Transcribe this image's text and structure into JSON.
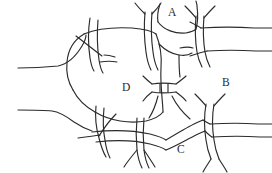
{
  "figure": {
    "background_color": "#ffffff",
    "stroke_color": "#2b2b2b",
    "label_color": "#2b2b2b",
    "width": 272,
    "height": 173,
    "labels": [
      {
        "id": "A",
        "text": "A",
        "x": 168,
        "y": 7
      },
      {
        "id": "B",
        "text": "B",
        "x": 222,
        "y": 77
      },
      {
        "id": "C",
        "text": "C",
        "x": 177,
        "y": 144
      },
      {
        "id": "D",
        "text": "D",
        "x": 122,
        "y": 82
      }
    ]
  }
}
